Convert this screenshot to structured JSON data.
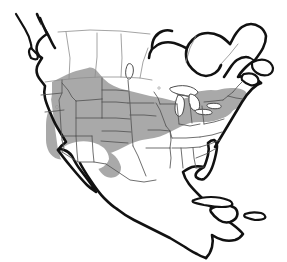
{
  "figure": {
    "type": "species-range-map",
    "region": "North America",
    "width": 287,
    "height": 262,
    "background_color": "#ffffff"
  },
  "styles": {
    "range_fill_color": "#a9a9a9",
    "range_gap_color": "#ffffff",
    "coastline_color": "#111111",
    "internal_border_color": "#555555",
    "faint_border_color": "#8d8d8d",
    "lake_fill_color": "#ffffff"
  },
  "range": {
    "description": "Shaded distribution covering western and central United States, southern Canadian prairies, the Great Lakes and the Northeast",
    "gap_description": "Unshaded area in the desert Southwest",
    "northern_limit": "southern Canadian prairie provinces",
    "southern_limit": "northern Mexico / Gulf coastal plain",
    "eastern_limit": "New England and Atlantic seaboard",
    "western_limit": "Pacific coast ranges"
  },
  "landmasses": [
    {
      "name": "north-american-mainland"
    },
    {
      "name": "baja-california-peninsula"
    },
    {
      "name": "newfoundland"
    },
    {
      "name": "nova-scotia"
    },
    {
      "name": "vancouver-island"
    },
    {
      "name": "alaska-panhandle"
    },
    {
      "name": "cuba"
    },
    {
      "name": "hispaniola"
    },
    {
      "name": "florida-peninsula"
    },
    {
      "name": "yucatan-peninsula"
    }
  ],
  "water_bodies": [
    {
      "name": "hudson-bay"
    },
    {
      "name": "lake-superior"
    },
    {
      "name": "lake-michigan"
    },
    {
      "name": "lake-huron"
    },
    {
      "name": "lake-erie"
    },
    {
      "name": "lake-ontario"
    },
    {
      "name": "lake-winnipeg"
    },
    {
      "name": "great-salt-lake"
    }
  ],
  "political_divisions": {
    "note": "United States state boundaries and Canadian province boundaries drawn as thin interior lines",
    "us_states_visible": true,
    "canadian_provinces_visible": true,
    "mexican_states_visible": false
  }
}
